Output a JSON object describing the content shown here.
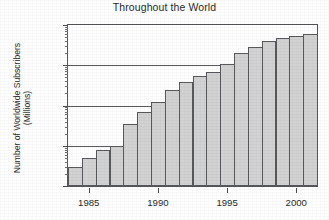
{
  "chart_data": {
    "type": "bar",
    "title": "Throughout the World",
    "xlabel": "",
    "ylabel": "Number of Worldwide Subscribers (Millions)",
    "ylabel_lines": [
      "Number of Worldwide Subscribers",
      "(Millions)"
    ],
    "yscale": "log",
    "ylim": [
      0.1,
      1000
    ],
    "ytick_labels": [
      "0.1",
      "1",
      "10",
      "100",
      "1000"
    ],
    "ytick_values": [
      0.1,
      1,
      10,
      100,
      1000
    ],
    "grid": true,
    "legend": false,
    "xlim": [
      1983.5,
      2001.5
    ],
    "xtick_labels": [
      "1985",
      "1990",
      "1995",
      "2000"
    ],
    "xtick_values": [
      1985,
      1990,
      1995,
      2000
    ],
    "categories": [
      1984,
      1985,
      1986,
      1987,
      1988,
      1989,
      1990,
      1991,
      1992,
      1993,
      1994,
      1995,
      1996,
      1997,
      1998,
      1999,
      2000,
      2001
    ],
    "values": [
      0.3,
      0.5,
      0.8,
      1.0,
      3.5,
      7.0,
      12,
      24,
      38,
      54,
      70,
      110,
      200,
      290,
      400,
      480,
      520,
      600
    ]
  }
}
